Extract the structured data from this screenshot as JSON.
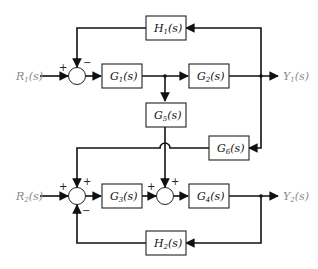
{
  "diagram": {
    "type": "block-diagram",
    "inputs": [
      {
        "id": "R1",
        "label": "R",
        "sub": "1",
        "suffix": "(s)"
      },
      {
        "id": "R2",
        "label": "R",
        "sub": "2",
        "suffix": "(s)"
      }
    ],
    "outputs": [
      {
        "id": "Y1",
        "label": "Y",
        "sub": "1",
        "suffix": "(s)"
      },
      {
        "id": "Y2",
        "label": "Y",
        "sub": "2",
        "suffix": "(s)"
      }
    ],
    "blocks": [
      {
        "id": "G1",
        "label": "G",
        "sub": "1",
        "suffix": "(s)"
      },
      {
        "id": "G2",
        "label": "G",
        "sub": "2",
        "suffix": "(s)"
      },
      {
        "id": "G3",
        "label": "G",
        "sub": "3",
        "suffix": "(s)"
      },
      {
        "id": "G4",
        "label": "G",
        "sub": "4",
        "suffix": "(s)"
      },
      {
        "id": "G5",
        "label": "G",
        "sub": "5",
        "suffix": "(s)"
      },
      {
        "id": "G6",
        "label": "G",
        "sub": "6",
        "suffix": "(s)"
      },
      {
        "id": "H1",
        "label": "H",
        "sub": "1",
        "suffix": "(s)"
      },
      {
        "id": "H2",
        "label": "H",
        "sub": "2",
        "suffix": "(s)"
      }
    ],
    "summing_junctions": [
      {
        "id": "S1",
        "signs": {
          "left": "+",
          "top": "−"
        }
      },
      {
        "id": "S2",
        "signs": {
          "left": "+",
          "top": "+",
          "bottom": "−"
        }
      },
      {
        "id": "S3",
        "signs": {
          "left": "+",
          "top": "+"
        }
      }
    ]
  }
}
